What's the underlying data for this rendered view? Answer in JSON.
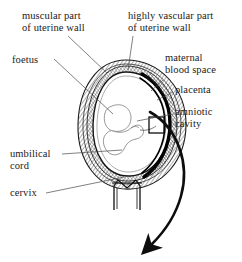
{
  "figure": {
    "background_color": "#ffffff",
    "ink_color": "#1a1a1a",
    "labels": [
      {
        "id": "muscular-part",
        "text": "muscular part\nof uterine wall",
        "x": 22,
        "y": 10
      },
      {
        "id": "highly-vascular-part",
        "text": "highly vascular part\nof uterine wall",
        "x": 128,
        "y": 10
      },
      {
        "id": "foetus",
        "text": "foetus",
        "x": 12,
        "y": 54
      },
      {
        "id": "maternal-blood-space",
        "text": "maternal\nblood space",
        "x": 165,
        "y": 52
      },
      {
        "id": "placenta",
        "text": "placenta",
        "x": 175,
        "y": 89
      },
      {
        "id": "amniotic-cavity",
        "text": "amniotic\ncavity",
        "x": 175,
        "y": 110
      },
      {
        "id": "umbilical-cord",
        "text": "umbilical\ncord",
        "x": 10,
        "y": 150
      },
      {
        "id": "cervix",
        "text": "cervix",
        "x": 10,
        "y": 192
      }
    ],
    "structures": [
      {
        "id": "uterine-wall-outer",
        "name": "outer uterine wall (hatched)"
      },
      {
        "id": "uterine-wall-muscular",
        "name": "muscular layer"
      },
      {
        "id": "uterine-wall-vascular",
        "name": "highly vascular layer"
      },
      {
        "id": "amniotic-cavity-region",
        "name": "amniotic cavity"
      },
      {
        "id": "foetus-body",
        "name": "foetus"
      },
      {
        "id": "placenta-arc",
        "name": "placenta"
      },
      {
        "id": "maternal-blood-space-region",
        "name": "maternal blood space"
      },
      {
        "id": "umbilical-cord-line",
        "name": "umbilical cord"
      },
      {
        "id": "cervix-canal",
        "name": "cervix"
      },
      {
        "id": "magnifier-box",
        "name": "detail box on placenta"
      },
      {
        "id": "blood-flow-arrow",
        "name": "curved flow arrow"
      }
    ]
  }
}
